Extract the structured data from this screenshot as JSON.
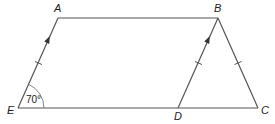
{
  "diagram": {
    "vertices": {
      "A": {
        "label": "A",
        "x": 58,
        "y": 18
      },
      "B": {
        "label": "B",
        "x": 218,
        "y": 18
      },
      "C": {
        "label": "C",
        "x": 258,
        "y": 108
      },
      "D": {
        "label": "D",
        "x": 178,
        "y": 108
      },
      "E": {
        "label": "E",
        "x": 18,
        "y": 108
      }
    },
    "edges": [
      [
        "A",
        "B"
      ],
      [
        "E",
        "A"
      ],
      [
        "E",
        "C"
      ],
      [
        "D",
        "B"
      ],
      [
        "B",
        "C"
      ]
    ],
    "parallel_marks": [
      {
        "segment": "EA",
        "arrow": "single"
      },
      {
        "segment": "DB",
        "arrow": "single"
      }
    ],
    "equal_marks": [
      {
        "segment": "EA",
        "ticks": 1
      },
      {
        "segment": "DB",
        "ticks": 1
      },
      {
        "segment": "BC",
        "ticks": 1
      }
    ],
    "angle": {
      "vertex": "E",
      "text": "70°",
      "value": 70
    },
    "colors": {
      "stroke": "#555555",
      "text": "#222222"
    }
  }
}
